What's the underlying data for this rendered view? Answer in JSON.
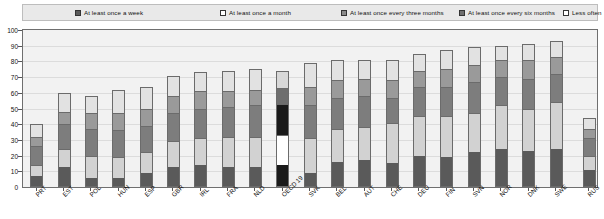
{
  "chart_data": {
    "type": "bar",
    "subtype": "stacked-column",
    "title": "",
    "xlabel": "",
    "ylabel": "",
    "ylim": [
      0,
      100
    ],
    "yticks": [
      0,
      10,
      20,
      30,
      40,
      50,
      60,
      70,
      80,
      90,
      100
    ],
    "grid": true,
    "legend_position": "top",
    "categories": [
      "PRT",
      "EST",
      "POL",
      "HUN",
      "ESP",
      "GBR",
      "IRL",
      "FRA",
      "NLD",
      "OECD 19",
      "SVK",
      "BEL",
      "AUT",
      "CHE",
      "DEU",
      "FIN",
      "SVN",
      "NOR",
      "DNK",
      "SWE",
      "RUS"
    ],
    "series": [
      {
        "name": "At least once a week",
        "color": "#5a5a5a",
        "values": [
          7,
          13,
          6,
          6,
          9,
          13,
          14,
          13,
          13,
          14,
          9,
          16,
          17,
          15,
          20,
          19,
          22,
          24,
          23,
          24,
          11
        ]
      },
      {
        "name": "At least once a month",
        "color": "#d2d2d2",
        "values": [
          7,
          11,
          14,
          13,
          13,
          16,
          17,
          19,
          19,
          19,
          22,
          21,
          21,
          26,
          25,
          26,
          25,
          28,
          27,
          30,
          9
        ]
      },
      {
        "name": "At least once every three months",
        "color": "#7d7d7d",
        "values": [
          12,
          16,
          17,
          17,
          17,
          18,
          19,
          19,
          20,
          20,
          21,
          20,
          20,
          16,
          19,
          19,
          20,
          18,
          19,
          18,
          11
        ]
      },
      {
        "name": "At least once every six months",
        "color": "#9a9a9a",
        "values": [
          6,
          8,
          10,
          11,
          11,
          11,
          11,
          10,
          10,
          10,
          12,
          11,
          11,
          11,
          10,
          11,
          11,
          11,
          12,
          11,
          6
        ]
      },
      {
        "name": "Less often",
        "color": "#e2e2e2",
        "values": [
          8,
          12,
          11,
          15,
          14,
          13,
          12,
          13,
          13,
          11,
          15,
          13,
          12,
          13,
          11,
          12,
          11,
          9,
          10,
          10,
          7
        ]
      }
    ],
    "totals": [
      40,
      60,
      58,
      62,
      64,
      71,
      73,
      74,
      75,
      74,
      79,
      81,
      81,
      81,
      85,
      87,
      89,
      90,
      91,
      93,
      44
    ],
    "highlight": {
      "category": "OECD 19",
      "index": 9,
      "colors": [
        "#1a1a1a",
        "#ffffff",
        "#1a1a1a",
        "#6e6e6e",
        "#d8d8d8"
      ]
    }
  },
  "legend": {
    "items": [
      {
        "label": "At least once a week",
        "swatch": "#5a5a5a"
      },
      {
        "label": "At least once a month",
        "swatch": "#ffffff"
      },
      {
        "label": "At least once every three months",
        "swatch": "#8a8a8a"
      },
      {
        "label": "At least once every six months",
        "swatch": "#6e6e6e"
      },
      {
        "label": "Less often",
        "swatch": "#ffffff"
      }
    ]
  }
}
